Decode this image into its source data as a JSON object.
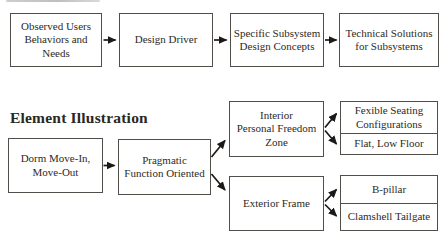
{
  "canvas": {
    "width": 443,
    "height": 240,
    "background": "#ffffff"
  },
  "colors": {
    "box_border": "#514e4a",
    "text": "#2e2a26",
    "arrow": "#1c1a18",
    "heading": "#2b2723",
    "cropped_strip": "#a8a8a8"
  },
  "top_flow": {
    "boxes": [
      {
        "label": "Observed Users\nBehaviors and\nNeeds"
      },
      {
        "label": "Design Driver"
      },
      {
        "label": "Specific Subsystem\nDesign Concepts"
      },
      {
        "label": "Technical Solutions\nfor Subsystems"
      }
    ]
  },
  "section": {
    "heading": "Element Illustration",
    "flow": {
      "source": {
        "label": "Dorm Move-In,\nMove-Out"
      },
      "driver": {
        "label": "Pragmatic\nFunction Oriented"
      },
      "branches": [
        {
          "concept": {
            "label": "Interior\nPersonal Freedom\nZone"
          },
          "solutions": [
            {
              "label": "Fexible Seating\nConfigurations"
            },
            {
              "label": "Flat, Low Floor"
            }
          ]
        },
        {
          "concept": {
            "label": "Exterior Frame"
          },
          "solutions": [
            {
              "label": "B-pillar"
            },
            {
              "label": "Clamshell Tailgate"
            }
          ]
        }
      ]
    }
  }
}
